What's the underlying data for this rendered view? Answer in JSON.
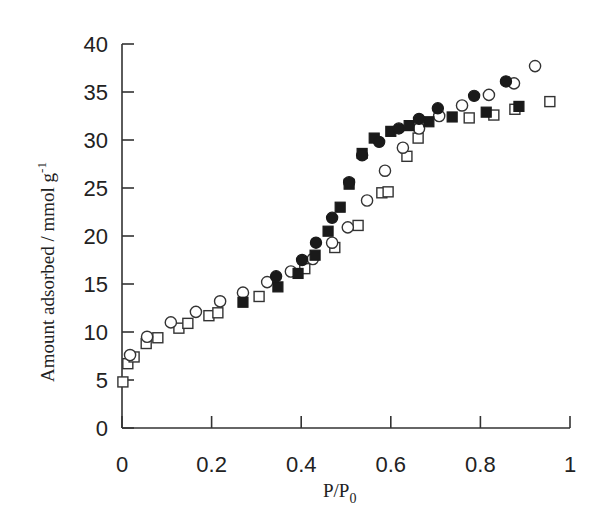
{
  "chart_data": {
    "type": "scatter",
    "title": "",
    "xlabel": "P/P0",
    "xlabel_main": "P/P",
    "xlabel_sub": "0",
    "ylabel": "Amount adsorbed / mmol g-1",
    "ylabel_main": "Amount adsorbed / mmol g",
    "ylabel_sup": "-1",
    "xlim": [
      0,
      1
    ],
    "ylim": [
      0,
      40
    ],
    "xticks": [
      0,
      0.2,
      0.4,
      0.6,
      0.8,
      1
    ],
    "xtick_labels": [
      "0",
      "0.2",
      "0.4",
      "0.6",
      "0.8",
      "1"
    ],
    "yticks": [
      0,
      5,
      10,
      15,
      20,
      25,
      30,
      35,
      40
    ],
    "ytick_labels": [
      "0",
      "5",
      "10",
      "15",
      "20",
      "25",
      "30",
      "35",
      "40"
    ],
    "grid": false,
    "legend": null,
    "series": [
      {
        "name": "open-squares",
        "marker": "square",
        "filled": false,
        "x": [
          0.002,
          0.013,
          0.027,
          0.054,
          0.08,
          0.127,
          0.147,
          0.194,
          0.214,
          0.306,
          0.408,
          0.475,
          0.527,
          0.58,
          0.594,
          0.636,
          0.661,
          0.775,
          0.83,
          0.877,
          0.955
        ],
        "y": [
          4.8,
          6.7,
          7.4,
          8.8,
          9.4,
          10.4,
          10.9,
          11.7,
          12.0,
          13.7,
          16.6,
          18.8,
          21.1,
          24.5,
          24.6,
          28.3,
          30.2,
          32.3,
          32.6,
          33.2,
          34.0
        ]
      },
      {
        "name": "open-circles",
        "marker": "circle",
        "filled": false,
        "x": [
          0.018,
          0.056,
          0.109,
          0.165,
          0.219,
          0.27,
          0.324,
          0.377,
          0.426,
          0.469,
          0.504,
          0.547,
          0.587,
          0.627,
          0.663,
          0.708,
          0.759,
          0.819,
          0.875,
          0.922
        ],
        "y": [
          7.6,
          9.5,
          11.0,
          12.1,
          13.2,
          14.1,
          15.2,
          16.3,
          17.6,
          19.3,
          20.9,
          23.7,
          26.8,
          29.2,
          31.2,
          32.5,
          33.6,
          34.7,
          35.9,
          37.7
        ]
      },
      {
        "name": "filled-squares",
        "marker": "square",
        "filled": true,
        "x": [
          0.27,
          0.348,
          0.393,
          0.431,
          0.46,
          0.487,
          0.507,
          0.536,
          0.563,
          0.6,
          0.641,
          0.685,
          0.737,
          0.813,
          0.886
        ],
        "y": [
          13.1,
          14.7,
          16.1,
          18.0,
          20.5,
          23.0,
          25.4,
          28.6,
          30.2,
          30.9,
          31.5,
          31.9,
          32.4,
          32.9,
          33.5
        ]
      },
      {
        "name": "filled-circles",
        "marker": "circle",
        "filled": true,
        "x": [
          0.344,
          0.402,
          0.433,
          0.469,
          0.507,
          0.536,
          0.574,
          0.618,
          0.663,
          0.705,
          0.786,
          0.857
        ],
        "y": [
          15.8,
          17.5,
          19.3,
          21.9,
          25.6,
          28.4,
          29.8,
          31.2,
          32.2,
          33.3,
          34.6,
          36.1
        ]
      }
    ]
  }
}
